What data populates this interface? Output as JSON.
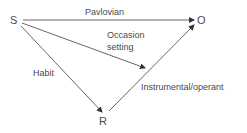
{
  "diagram": {
    "nodes": {
      "s": "S",
      "o": "O",
      "r": "R"
    },
    "edges": {
      "pavlovian": "Pavlovian",
      "occasion_setting_line1": "Occasion",
      "occasion_setting_line2": "setting",
      "habit": "Habit",
      "instrumental": "Instrumental/operant"
    },
    "colors": {
      "line": "#4a4a4a",
      "text": "#4a4a4a",
      "background": "#ffffff"
    }
  }
}
